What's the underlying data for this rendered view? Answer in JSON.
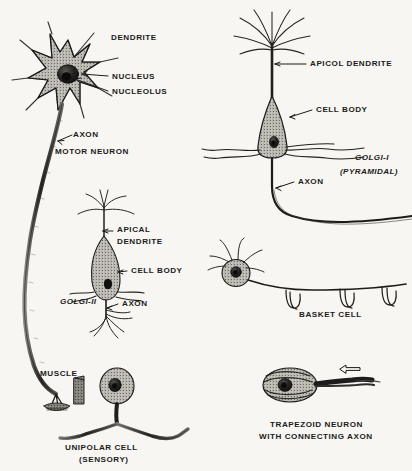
{
  "plate": {
    "title": "Types of Neurons",
    "background_color": "#f7f6f2",
    "ink_color": "#1b1b1b",
    "width": 412,
    "height": 471
  },
  "figures": {
    "motor_neuron": {
      "name": "Motor Neuron",
      "labels": {
        "dendrite": "DENDRITE",
        "nucleus": "NUCLEUS",
        "nucleolus": "NUCLEOLUS",
        "axon": "AXON",
        "caption": "MOTOR  NEURON",
        "muscle": "MUSCLE"
      }
    },
    "golgi_ii": {
      "name": "Golgi-II cell",
      "labels": {
        "apical_dendrite_line1": "APICAL",
        "apical_dendrite_line2": "DENDRITE",
        "cell_body": "CELL BODY",
        "axon": "AXON",
        "caption": "GOLGI-II"
      }
    },
    "unipolar_cell": {
      "name": "Unipolar sensory cell",
      "labels": {
        "caption_line1": "UNIPOLAR  CELL",
        "caption_line2": "(SENSORY)"
      }
    },
    "golgi_i_pyramidal": {
      "name": "Golgi-I pyramidal cell",
      "labels": {
        "apical_dendrite": "APICOL  DENDRITE",
        "cell_body": "CELL BODY",
        "axon": "AXON",
        "caption_line1": "GOLGI-I",
        "caption_line2": "(PYRAMIDAL)"
      }
    },
    "basket_cell": {
      "name": "Basket cell",
      "labels": {
        "caption": "BASKET  CELL"
      }
    },
    "trapezoid_neuron": {
      "name": "Trapezoid neuron",
      "labels": {
        "caption_line1": "TRAPEZOID  NEURON",
        "caption_line2": "WITH  CONNECTING  AXON"
      }
    }
  }
}
